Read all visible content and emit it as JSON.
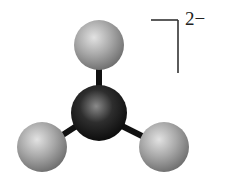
{
  "diagram": {
    "type": "ball-and-stick molecular model",
    "geometry": "trigonal planar",
    "charge_label": "2−",
    "atoms": [
      {
        "role": "central",
        "color": "#1a1a1a",
        "cx": 99,
        "cy": 113,
        "r": 28
      },
      {
        "role": "outer-top",
        "color": "#9a9a9a",
        "cx": 99,
        "cy": 45,
        "r": 25
      },
      {
        "role": "outer-bottom-left",
        "color": "#9a9a9a",
        "cx": 42,
        "cy": 147,
        "r": 25
      },
      {
        "role": "outer-bottom-right",
        "color": "#9a9a9a",
        "cx": 164,
        "cy": 147,
        "r": 25
      }
    ],
    "bracket_color": "#333333"
  }
}
